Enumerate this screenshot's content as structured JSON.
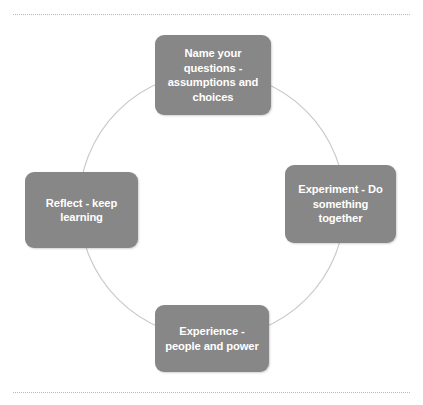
{
  "diagram": {
    "type": "cycle",
    "shape": "circle",
    "background_color": "#ffffff",
    "node_fill_color": "#878787",
    "node_text_color": "#ffffff",
    "circle_stroke_color": "#c8c8c8",
    "rule_color": "#b9b9b9",
    "rules": {
      "top_label": "top-dotted-divider",
      "bottom_label": "bottom-dotted-divider"
    },
    "nodes": [
      {
        "id": "name",
        "position": "top",
        "label": "Name your questions - assumptions and choices"
      },
      {
        "id": "experiment",
        "position": "right",
        "label": "Experiment - Do something together"
      },
      {
        "id": "experience",
        "position": "bottom",
        "label": "Experience - people and power"
      },
      {
        "id": "reflect",
        "position": "left",
        "label": "Reflect - keep learning"
      }
    ]
  }
}
